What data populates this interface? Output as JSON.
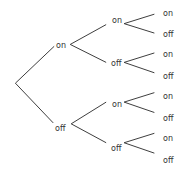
{
  "diagram": {
    "type": "probability-tree",
    "line_color": "#333333",
    "text_color": "#333333",
    "root": {
      "x": 11,
      "y": 88
    },
    "level1": [
      {
        "label": "on",
        "x": 56,
        "y": 46
      },
      {
        "label": "off",
        "x": 55,
        "y": 129
      }
    ],
    "level2": [
      {
        "label": "on",
        "x": 112,
        "y": 21
      },
      {
        "label": "off",
        "x": 111,
        "y": 63
      },
      {
        "label": "on",
        "x": 112,
        "y": 105
      },
      {
        "label": "off",
        "x": 111,
        "y": 148
      }
    ],
    "level3": [
      {
        "label": "on",
        "x": 163,
        "y": 11
      },
      {
        "label": "off",
        "x": 163,
        "y": 32
      },
      {
        "label": "on",
        "x": 163,
        "y": 52
      },
      {
        "label": "off",
        "x": 163,
        "y": 74
      },
      {
        "label": "on",
        "x": 163,
        "y": 95
      },
      {
        "label": "off",
        "x": 163,
        "y": 116
      },
      {
        "label": "on",
        "x": 163,
        "y": 137
      },
      {
        "label": "off",
        "x": 163,
        "y": 159
      }
    ]
  }
}
